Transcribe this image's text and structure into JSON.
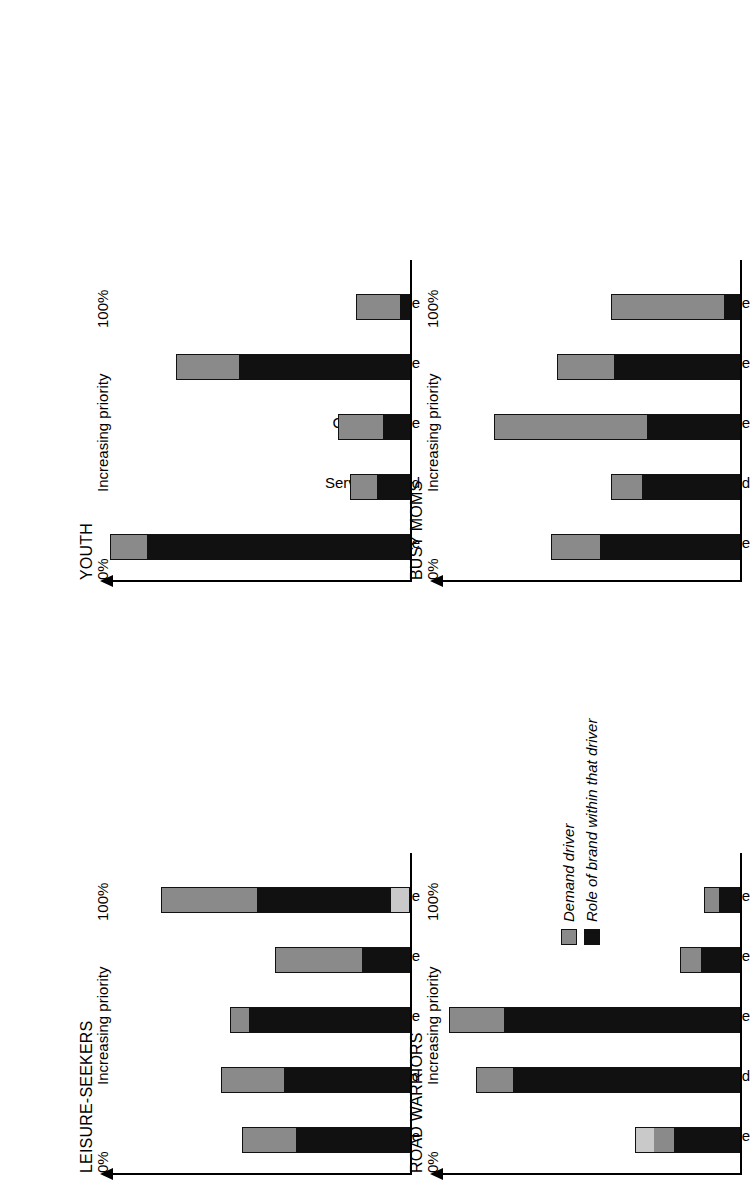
{
  "figure": {
    "orientation": "rotated-90-ccw",
    "axis_label": "Increasing priority",
    "tick_low": "0%",
    "tick_high": "100%",
    "categories": [
      "Friendly service",
      "Service speed",
      "Convenience",
      "Ambience",
      "Price"
    ],
    "colors": {
      "demand_driver": "#8a8a8a",
      "role_of_brand": "#111111",
      "light_segment": "#c9c9c9"
    }
  },
  "legend": {
    "items": [
      {
        "label": "Demand driver",
        "color": "#8a8a8a",
        "swatch_name": "demand-driver-swatch"
      },
      {
        "label": "Role of brand within that driver",
        "color": "#111111",
        "swatch_name": "role-of-brand-swatch"
      }
    ]
  },
  "chart_data": [
    {
      "type": "bar",
      "title": "YOUTH",
      "xlabel": "",
      "ylabel": "Increasing priority",
      "ylim": [
        0,
        100
      ],
      "tick_labels": [
        "0%",
        "100%"
      ],
      "grid": false,
      "legend_position": "external-bottom-right",
      "categories": [
        "Friendly service",
        "Service speed",
        "Convenience",
        "Ambience",
        "Price"
      ],
      "series": [
        {
          "name": "Role of brand within that driver",
          "color": "#111111",
          "values": [
            88,
            11,
            9,
            57,
            3
          ]
        },
        {
          "name": "Demand driver",
          "color": "#8a8a8a",
          "values": [
            12,
            9,
            15,
            21,
            15
          ]
        }
      ],
      "totals": [
        100,
        20,
        24,
        78,
        18
      ]
    },
    {
      "type": "bar",
      "title": "BUSY MOMS",
      "xlabel": "",
      "ylabel": "Increasing priority",
      "ylim": [
        0,
        100
      ],
      "tick_labels": [
        "0%",
        "100%"
      ],
      "grid": false,
      "legend_position": "external-bottom-right",
      "categories": [
        "Friendly service",
        "Service speed",
        "Convenience",
        "Ambience",
        "Price"
      ],
      "series": [
        {
          "name": "Role of brand within that driver",
          "color": "#111111",
          "values": [
            47,
            33,
            31,
            42,
            5
          ]
        },
        {
          "name": "Demand driver",
          "color": "#8a8a8a",
          "values": [
            16,
            10,
            51,
            19,
            38
          ]
        }
      ],
      "totals": [
        63,
        43,
        82,
        61,
        43
      ]
    },
    {
      "type": "bar",
      "title": "LEISURE-SEEKERS",
      "xlabel": "",
      "ylabel": "Increasing priority",
      "ylim": [
        0,
        100
      ],
      "tick_labels": [
        "0%",
        "100%"
      ],
      "grid": false,
      "legend_position": "external-bottom-right",
      "categories": [
        "Friendly service",
        "Service speed",
        "Convenience",
        "Ambience",
        "Price"
      ],
      "series": [
        {
          "name": "light base segment",
          "color": "#c9c9c9",
          "values": [
            0,
            0,
            0,
            0,
            6
          ]
        },
        {
          "name": "Role of brand within that driver",
          "color": "#111111",
          "values": [
            38,
            42,
            54,
            16,
            45
          ]
        },
        {
          "name": "Demand driver",
          "color": "#8a8a8a",
          "values": [
            18,
            21,
            6,
            29,
            32
          ]
        }
      ],
      "totals": [
        56,
        63,
        60,
        45,
        83
      ]
    },
    {
      "type": "bar",
      "title": "ROAD WARRIORS",
      "xlabel": "",
      "ylabel": "Increasing priority",
      "ylim": [
        0,
        100
      ],
      "tick_labels": [
        "0%",
        "100%"
      ],
      "grid": false,
      "legend_position": "external-bottom-right",
      "categories": [
        "Friendly service",
        "Service speed",
        "Convenience",
        "Ambience",
        "Price"
      ],
      "series": [
        {
          "name": "Role of brand within that driver",
          "color": "#111111",
          "values": [
            22,
            76,
            79,
            13,
            7
          ]
        },
        {
          "name": "Demand driver",
          "color": "#8a8a8a",
          "values": [
            7,
            12,
            18,
            7,
            5
          ]
        },
        {
          "name": "light top segment",
          "color": "#c9c9c9",
          "values": [
            6,
            0,
            0,
            0,
            0
          ]
        }
      ],
      "totals": [
        35,
        88,
        97,
        20,
        12
      ]
    }
  ]
}
